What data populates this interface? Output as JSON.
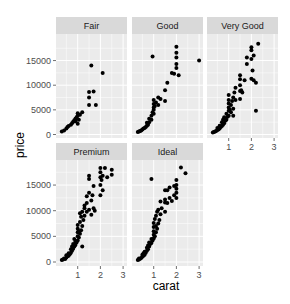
{
  "chart_data": {
    "type": "scatter",
    "title": "",
    "xlabel": "carat",
    "ylabel": "price",
    "facet_by": "cut",
    "xlim": [
      0.1,
      3.1
    ],
    "ylim": [
      0,
      19000
    ],
    "x_ticks": [
      1,
      2,
      3
    ],
    "y_ticks": [
      0,
      5000,
      10000,
      15000
    ],
    "y_tick_labels": [
      "0",
      "5000",
      "10000",
      "15000"
    ],
    "grid": true,
    "legend": "none",
    "colors": {
      "panel_bg": "#ebebeb",
      "strip_bg": "#d9d9d9",
      "grid": "#ffffff",
      "point": "#000000"
    },
    "panels": [
      {
        "name": "Fair",
        "points": [
          [
            0.3,
            600
          ],
          [
            0.4,
            800
          ],
          [
            0.5,
            1200
          ],
          [
            0.55,
            1500
          ],
          [
            0.6,
            1700
          ],
          [
            0.7,
            2000
          ],
          [
            0.75,
            2300
          ],
          [
            0.8,
            2600
          ],
          [
            0.85,
            2900
          ],
          [
            0.9,
            3200
          ],
          [
            0.9,
            2700
          ],
          [
            0.95,
            3500
          ],
          [
            1.0,
            3800
          ],
          [
            1.0,
            4300
          ],
          [
            1.0,
            2200
          ],
          [
            1.05,
            3000
          ],
          [
            1.1,
            4000
          ],
          [
            1.2,
            4500
          ],
          [
            1.5,
            6000
          ],
          [
            1.5,
            7500
          ],
          [
            1.5,
            8600
          ],
          [
            1.6,
            14000
          ],
          [
            1.7,
            8700
          ],
          [
            1.8,
            6000
          ],
          [
            2.1,
            12500
          ]
        ]
      },
      {
        "name": "Good",
        "points": [
          [
            0.3,
            500
          ],
          [
            0.35,
            600
          ],
          [
            0.4,
            700
          ],
          [
            0.45,
            800
          ],
          [
            0.5,
            1000
          ],
          [
            0.55,
            1200
          ],
          [
            0.6,
            1300
          ],
          [
            0.65,
            1500
          ],
          [
            0.7,
            1800
          ],
          [
            0.7,
            2400
          ],
          [
            0.75,
            2000
          ],
          [
            0.8,
            2500
          ],
          [
            0.8,
            3200
          ],
          [
            0.9,
            3000
          ],
          [
            0.9,
            3800
          ],
          [
            0.95,
            4500
          ],
          [
            1.0,
            4200
          ],
          [
            1.0,
            5000
          ],
          [
            1.0,
            5500
          ],
          [
            1.0,
            6200
          ],
          [
            1.0,
            7000
          ],
          [
            1.05,
            5800
          ],
          [
            1.1,
            6500
          ],
          [
            1.2,
            6000
          ],
          [
            1.2,
            7500
          ],
          [
            1.3,
            7200
          ],
          [
            1.5,
            9000
          ],
          [
            1.6,
            10500
          ],
          [
            1.5,
            6800
          ],
          [
            0.95,
            15800
          ],
          [
            1.8,
            12500
          ],
          [
            1.9,
            12300
          ],
          [
            2.0,
            13500
          ],
          [
            2.0,
            14300
          ],
          [
            2.0,
            15600
          ],
          [
            2.0,
            16600
          ],
          [
            2.0,
            17800
          ],
          [
            2.1,
            12000
          ],
          [
            3.0,
            15000
          ]
        ]
      },
      {
        "name": "Very Good",
        "points": [
          [
            0.3,
            400
          ],
          [
            0.35,
            500
          ],
          [
            0.4,
            600
          ],
          [
            0.45,
            700
          ],
          [
            0.5,
            900
          ],
          [
            0.5,
            1300
          ],
          [
            0.55,
            1000
          ],
          [
            0.6,
            1200
          ],
          [
            0.6,
            1800
          ],
          [
            0.65,
            1500
          ],
          [
            0.7,
            1700
          ],
          [
            0.7,
            2500
          ],
          [
            0.75,
            2000
          ],
          [
            0.75,
            3000
          ],
          [
            0.8,
            2300
          ],
          [
            0.8,
            3500
          ],
          [
            0.85,
            2800
          ],
          [
            0.9,
            3000
          ],
          [
            0.9,
            4200
          ],
          [
            0.95,
            3600
          ],
          [
            1.0,
            3800
          ],
          [
            1.0,
            4800
          ],
          [
            1.0,
            5500
          ],
          [
            1.0,
            6300
          ],
          [
            1.0,
            7000
          ],
          [
            1.0,
            8000
          ],
          [
            1.05,
            5000
          ],
          [
            1.1,
            6000
          ],
          [
            1.1,
            4500
          ],
          [
            1.15,
            6800
          ],
          [
            1.2,
            7500
          ],
          [
            1.2,
            5200
          ],
          [
            1.25,
            8500
          ],
          [
            1.3,
            7000
          ],
          [
            1.3,
            9500
          ],
          [
            1.5,
            8800
          ],
          [
            1.5,
            10000
          ],
          [
            1.5,
            11200
          ],
          [
            1.5,
            12000
          ],
          [
            1.5,
            7200
          ],
          [
            1.55,
            9000
          ],
          [
            1.6,
            8500
          ],
          [
            1.7,
            11000
          ],
          [
            1.8,
            15600
          ],
          [
            1.8,
            14300
          ],
          [
            2.0,
            17700
          ],
          [
            2.0,
            17100
          ],
          [
            2.0,
            15300
          ],
          [
            2.05,
            13000
          ],
          [
            2.1,
            16000
          ],
          [
            2.1,
            11000
          ],
          [
            2.2,
            10500
          ],
          [
            2.2,
            4800
          ],
          [
            2.3,
            18400
          ],
          [
            2.0,
            11300
          ],
          [
            1.2,
            3800
          ]
        ]
      },
      {
        "name": "Premium",
        "points": [
          [
            0.3,
            400
          ],
          [
            0.35,
            500
          ],
          [
            0.4,
            700
          ],
          [
            0.45,
            600
          ],
          [
            0.5,
            900
          ],
          [
            0.5,
            1300
          ],
          [
            0.55,
            1100
          ],
          [
            0.6,
            1200
          ],
          [
            0.6,
            1700
          ],
          [
            0.65,
            1500
          ],
          [
            0.7,
            1800
          ],
          [
            0.7,
            2500
          ],
          [
            0.75,
            2200
          ],
          [
            0.75,
            3000
          ],
          [
            0.8,
            2600
          ],
          [
            0.8,
            3500
          ],
          [
            0.85,
            3000
          ],
          [
            0.85,
            4500
          ],
          [
            0.9,
            3300
          ],
          [
            0.9,
            4000
          ],
          [
            0.95,
            3800
          ],
          [
            1.0,
            4200
          ],
          [
            1.0,
            5000
          ],
          [
            1.0,
            5800
          ],
          [
            1.0,
            6500
          ],
          [
            1.0,
            7200
          ],
          [
            1.05,
            4800
          ],
          [
            1.05,
            6000
          ],
          [
            1.1,
            5500
          ],
          [
            1.1,
            7800
          ],
          [
            1.1,
            9500
          ],
          [
            1.15,
            6200
          ],
          [
            1.15,
            8800
          ],
          [
            1.2,
            9800
          ],
          [
            1.2,
            7000
          ],
          [
            1.25,
            8200
          ],
          [
            1.3,
            9000
          ],
          [
            1.3,
            10500
          ],
          [
            1.3,
            11000
          ],
          [
            1.4,
            9800
          ],
          [
            1.4,
            11500
          ],
          [
            1.4,
            12800
          ],
          [
            1.5,
            13500
          ],
          [
            1.5,
            10200
          ],
          [
            1.5,
            16800
          ],
          [
            1.5,
            16200
          ],
          [
            1.6,
            12000
          ],
          [
            1.6,
            9200
          ],
          [
            1.65,
            13000
          ],
          [
            1.7,
            10500
          ],
          [
            1.7,
            14800
          ],
          [
            1.75,
            10000
          ],
          [
            2.0,
            16500
          ],
          [
            2.0,
            18300
          ],
          [
            2.0,
            15000
          ],
          [
            2.0,
            17500
          ],
          [
            2.05,
            16000
          ],
          [
            2.1,
            14000
          ],
          [
            2.2,
            18300
          ],
          [
            2.1,
            16800
          ],
          [
            2.5,
            18000
          ],
          [
            2.5,
            17000
          ],
          [
            2.3,
            16500
          ],
          [
            2.0,
            13000
          ],
          [
            1.2,
            3000
          ]
        ]
      },
      {
        "name": "Ideal",
        "points": [
          [
            0.3,
            400
          ],
          [
            0.35,
            500
          ],
          [
            0.35,
            700
          ],
          [
            0.4,
            650
          ],
          [
            0.45,
            800
          ],
          [
            0.5,
            1000
          ],
          [
            0.5,
            1400
          ],
          [
            0.55,
            1200
          ],
          [
            0.55,
            1700
          ],
          [
            0.6,
            1400
          ],
          [
            0.6,
            2000
          ],
          [
            0.65,
            1800
          ],
          [
            0.7,
            2200
          ],
          [
            0.7,
            2800
          ],
          [
            0.75,
            2500
          ],
          [
            0.75,
            3200
          ],
          [
            0.8,
            3000
          ],
          [
            0.8,
            3800
          ],
          [
            0.85,
            3500
          ],
          [
            0.9,
            3700
          ],
          [
            0.9,
            4500
          ],
          [
            0.95,
            4200
          ],
          [
            1.0,
            4600
          ],
          [
            1.0,
            5300
          ],
          [
            1.0,
            6000
          ],
          [
            1.0,
            6800
          ],
          [
            1.0,
            7600
          ],
          [
            1.05,
            5000
          ],
          [
            1.05,
            8400
          ],
          [
            1.1,
            5800
          ],
          [
            1.1,
            7000
          ],
          [
            1.1,
            9000
          ],
          [
            1.15,
            6500
          ],
          [
            1.15,
            9800
          ],
          [
            1.2,
            7500
          ],
          [
            1.2,
            10200
          ],
          [
            1.25,
            8200
          ],
          [
            1.3,
            9300
          ],
          [
            1.3,
            11800
          ],
          [
            1.35,
            10500
          ],
          [
            1.5,
            11600
          ],
          [
            1.5,
            12200
          ],
          [
            1.5,
            9800
          ],
          [
            1.5,
            14000
          ],
          [
            1.6,
            14000
          ],
          [
            1.6,
            11500
          ],
          [
            1.7,
            12500
          ],
          [
            1.7,
            14500
          ],
          [
            1.9,
            13000
          ],
          [
            1.9,
            14800
          ],
          [
            2.0,
            16000
          ],
          [
            2.0,
            14300
          ],
          [
            2.0,
            15000
          ],
          [
            2.0,
            13500
          ],
          [
            2.0,
            12500
          ],
          [
            2.2,
            18400
          ],
          [
            2.4,
            17300
          ],
          [
            0.9,
            16200
          ],
          [
            1.8,
            11900
          ]
        ]
      }
    ]
  }
}
